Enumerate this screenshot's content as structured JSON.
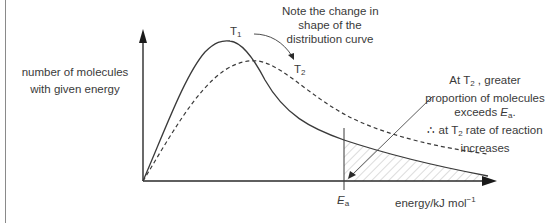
{
  "diagram": {
    "type": "Maxwell-Boltzmann distribution",
    "y_axis_label_line1": "number of molecules",
    "y_axis_label_line2": "with given energy",
    "x_axis_label": "energy/kJ mol",
    "x_axis_label_superscript": "−1",
    "ea_label": "E",
    "ea_subscript": "a",
    "curves": [
      {
        "name": "T",
        "subscript": "1",
        "style": "solid"
      },
      {
        "name": "T",
        "subscript": "2",
        "style": "dashed"
      }
    ],
    "note": {
      "line1": "Note the change in",
      "line2": "shape of the",
      "line3": "distribution curve"
    },
    "annotation": {
      "line1_a": "At T",
      "line1_sub": "2",
      "line1_b": " , greater",
      "line2": "proportion of molecules",
      "line3_a": "exceeds ",
      "line3_ea": "E",
      "line3_ea_sub": "a",
      "line3_b": ".",
      "line4_a": "∴ at T",
      "line4_sub": "2",
      "line4_b": " rate of reaction",
      "line5": "increases"
    },
    "colors": {
      "line": "#3a3a3a",
      "hatch": "#9a9a9a",
      "frame": "#8a8a8a"
    }
  }
}
